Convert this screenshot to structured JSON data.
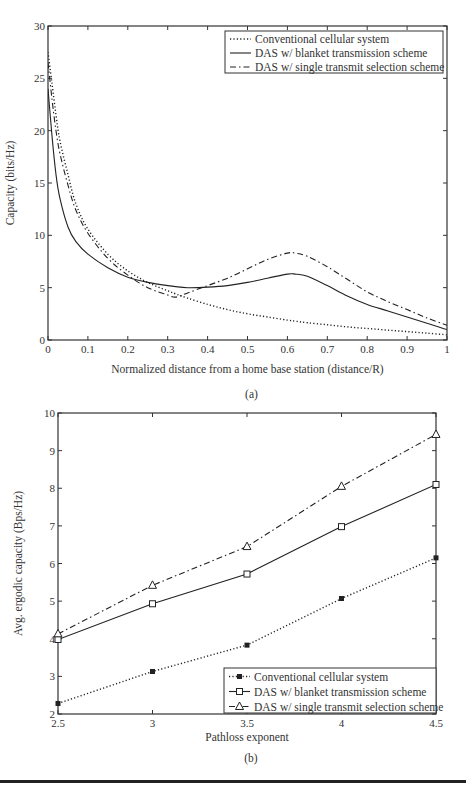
{
  "chart_data": [
    {
      "id": "a",
      "type": "line",
      "caption": "(a)",
      "title": "",
      "xlabel": "Normalized distance from a home base station (distance/R)",
      "ylabel": "Capacity (bits/Hz)",
      "xlim": [
        0,
        1
      ],
      "ylim": [
        0,
        30
      ],
      "xticks": [
        "0",
        "0.1",
        "0.2",
        "0.3",
        "0.4",
        "0.5",
        "0.6",
        "0.7",
        "0.8",
        "0.9",
        "1"
      ],
      "yticks": [
        "0",
        "5",
        "10",
        "15",
        "20",
        "25",
        "30"
      ],
      "grid": false,
      "legend_position": "upper right",
      "x": [
        0.0,
        0.01,
        0.02,
        0.03,
        0.05,
        0.07,
        0.1,
        0.15,
        0.2,
        0.25,
        0.3,
        0.32,
        0.35,
        0.4,
        0.45,
        0.5,
        0.55,
        0.6,
        0.62,
        0.65,
        0.7,
        0.75,
        0.8,
        0.85,
        0.9,
        0.95,
        1.0
      ],
      "series": [
        {
          "name": "Conventional cellular system",
          "style": "dotted",
          "values": [
            27.5,
            24.5,
            21.5,
            19.0,
            15.8,
            13.0,
            10.6,
            8.2,
            6.6,
            5.5,
            4.7,
            4.4,
            4.0,
            3.4,
            2.9,
            2.5,
            2.2,
            1.9,
            1.8,
            1.65,
            1.45,
            1.25,
            1.1,
            0.95,
            0.8,
            0.65,
            0.5
          ]
        },
        {
          "name": "DAS w/ blanket transmission scheme",
          "style": "solid",
          "values": [
            24.0,
            19.5,
            15.8,
            13.5,
            10.8,
            9.4,
            8.2,
            6.9,
            6.0,
            5.5,
            5.2,
            5.1,
            5.0,
            5.05,
            5.2,
            5.5,
            5.9,
            6.3,
            6.3,
            6.1,
            5.2,
            4.2,
            3.4,
            2.8,
            2.2,
            1.6,
            1.0
          ]
        },
        {
          "name": "DAS w/ single transmit selection scheme",
          "style": "dashdot",
          "values": [
            26.5,
            23.0,
            20.0,
            17.8,
            14.8,
            12.4,
            10.2,
            7.8,
            6.2,
            5.0,
            4.3,
            4.1,
            4.5,
            5.2,
            5.9,
            6.8,
            7.7,
            8.3,
            8.3,
            8.0,
            7.0,
            5.8,
            4.6,
            3.7,
            2.9,
            2.1,
            1.4
          ]
        }
      ]
    },
    {
      "id": "b",
      "type": "line",
      "caption": "(b)",
      "title": "",
      "xlabel": "Pathloss exponent",
      "ylabel": "Avg. ergodic capacity (Bps/Hz)",
      "xlim": [
        2.5,
        4.5
      ],
      "ylim": [
        2,
        10
      ],
      "xticks": [
        "2.5",
        "3",
        "3.5",
        "4",
        "4.5"
      ],
      "yticks": [
        "2",
        "3",
        "4",
        "5",
        "6",
        "7",
        "8",
        "9",
        "10"
      ],
      "grid": false,
      "legend_position": "lower right",
      "categories": [
        2.5,
        3,
        3.5,
        4,
        4.5
      ],
      "series": [
        {
          "name": "Conventional cellular system",
          "style": "dotted",
          "marker": "star",
          "values": [
            2.28,
            3.13,
            3.83,
            5.07,
            6.15
          ]
        },
        {
          "name": "DAS w/ blanket transmission scheme",
          "style": "solid",
          "marker": "square",
          "values": [
            3.98,
            4.93,
            5.72,
            6.98,
            8.1
          ]
        },
        {
          "name": "DAS w/ single transmit selection scheme",
          "style": "dashdot",
          "marker": "triangle",
          "values": [
            4.13,
            5.42,
            6.45,
            8.05,
            9.43
          ]
        }
      ]
    }
  ]
}
